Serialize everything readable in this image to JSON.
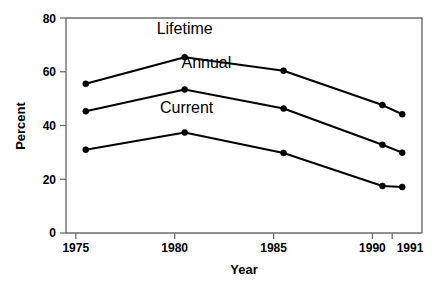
{
  "chart_data": {
    "type": "line",
    "title": "",
    "xlabel": "Year",
    "ylabel": "Percent",
    "x": [
      1975,
      1980,
      1985,
      1990,
      1991
    ],
    "categories": [
      "1975",
      "1980",
      "1985",
      "1990",
      "1991"
    ],
    "xlim": [
      1974,
      1992
    ],
    "ylim": [
      0,
      80
    ],
    "yticks": [
      0,
      20,
      40,
      60,
      80
    ],
    "ytick_labels": [
      "0",
      "20",
      "40",
      "60",
      "80"
    ],
    "grid": false,
    "legend": "inline-labels",
    "series": [
      {
        "name": "Lifetime",
        "values": [
          55.5,
          65.4,
          60.4,
          47.6,
          44.2
        ],
        "label_x": 1980.0,
        "label_y": 74.0
      },
      {
        "name": "Annual",
        "values": [
          45.3,
          53.4,
          46.3,
          32.8,
          29.9
        ],
        "label_x": 1981.1,
        "label_y": 61.5
      },
      {
        "name": "Current",
        "values": [
          31.0,
          37.4,
          29.8,
          17.5,
          17.1
        ],
        "label_x": 1980.1,
        "label_y": 44.5
      }
    ],
    "marker": "filled-circle",
    "line_color": "#000000",
    "axis_color": "#6e6e6e",
    "background_color": "#ffffff"
  },
  "axes": {
    "y_title": "Percent",
    "x_title": "Year"
  }
}
